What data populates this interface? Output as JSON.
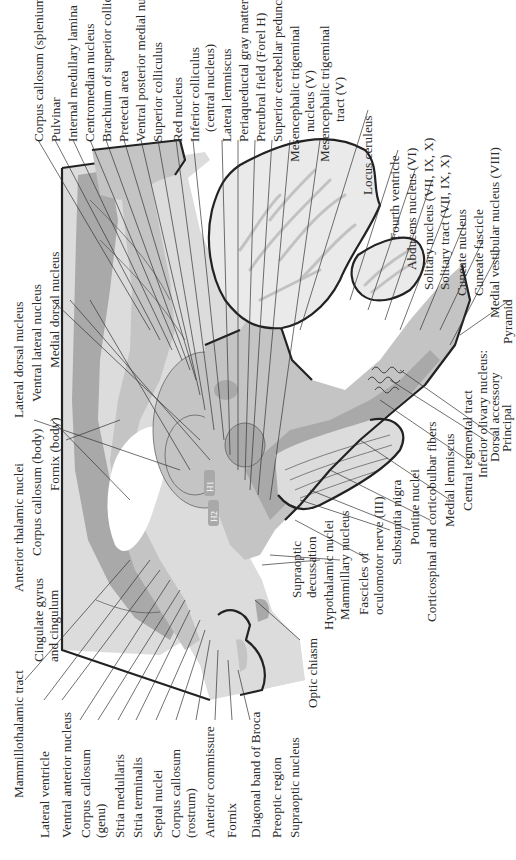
{
  "figure": {
    "orientation": "rotated-90-ccw",
    "internal_markers": [
      "H1",
      "H2"
    ],
    "colors": {
      "background": "#ffffff",
      "dark_gray_tracts": "#a9a9a9",
      "mid_gray_nuclei": "#c4c4c4",
      "light_gray_tissue": "#dcdcdc",
      "outline": "#222222",
      "text": "#2a2a2a"
    }
  },
  "labels": {
    "top": [
      "Corpus callosum (splenium)",
      "Pulvinar",
      "Internal medullary lamina",
      "Centromedian nucleus",
      "Brachium of superior colliculus",
      "Pretectal area",
      "Ventral posterior medial nucleus",
      "Superior colliculus",
      "Red nucleus",
      "Inferior colliculus",
      "(central nucleus)",
      "Lateral lemniscus",
      "Periaqueductal gray matter",
      "Prerubral field (Forel H)",
      "Superior cerebellar peduncle",
      "Mesencephalic trigeminal",
      "nucleus (V)",
      "Mesencephalic trigeminal",
      "tract (V)",
      "Locus ceruleus"
    ],
    "right": [
      "Fourth ventricle",
      "Abducens nucleus (VI)",
      "Solitary nucleus (VII, IX, X)",
      "Solitary tract (VII, IX, X)",
      "Cuneate nucleus",
      "Cuneate fascicle",
      "Medial vestibular nucleus (VIII)",
      "Pyramid"
    ],
    "left_upper": [
      "Lateral dorsal nucleus",
      "Ventral lateral nucleus",
      "Medial dorsal nucleus",
      "Anterior thalamic nuclei",
      "Corpus callosum (body)",
      "Fornix (body)",
      "Cingulate gyrus",
      "and cingulum"
    ],
    "bottom_left": [
      "Mammillothalamic tract",
      "Lateral ventricle",
      "Ventral anterior nucleus",
      "Corpus callosum",
      "(genu)",
      "Stria medullaris",
      "Stria terminalis",
      "Septal nuclei",
      "Corpus callosum",
      "(rostrum)",
      "Anterior commissure",
      "Fornix",
      "Diagonal band of Broca",
      "Preoptic region",
      "Supraoptic nucleus"
    ],
    "bottom_right": [
      "Optic chiasm",
      "Supraoptic",
      "decussation",
      "Hypothalamic nuclei",
      "Mammillary nucleus",
      "Fascicles of",
      "oculomotor nerve (III)",
      "Substantia nigra",
      "Pontine nuclei",
      "Corticospinal and corticobulbar fibers",
      "Medial lemniscus",
      "Central tegmental tract",
      "Inferior olivary nucleus:",
      "Dorsal accessory",
      "Principal"
    ]
  }
}
